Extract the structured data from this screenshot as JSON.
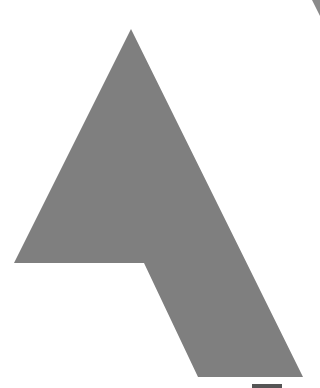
{
  "figure": {
    "glyph": "A",
    "fill_color": "#7f7f7f",
    "background": "#ffffff",
    "polygon": [
      [
        131,
        29
      ],
      [
        303,
        377
      ],
      [
        198,
        377
      ],
      [
        144,
        263
      ],
      [
        14,
        263
      ]
    ],
    "corner_arc_color": "#8a8a8a",
    "bottom_bar_color": "#555555"
  }
}
